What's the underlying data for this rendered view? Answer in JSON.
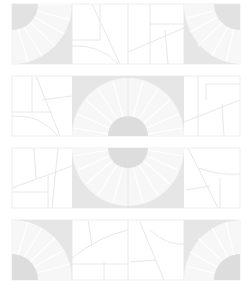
{
  "diagram": {
    "type": "tile-pattern",
    "rows": 4,
    "columns": 4,
    "colors": {
      "background": "#ffffff",
      "tile_fill": "#e6e6e6",
      "disc_fill": "#dddddd",
      "line": "#e8e8e8",
      "border": "#ececec"
    },
    "strips": [
      {
        "index": 1,
        "description": "quarter-circle staircase tiles at both ends, line tiles in middle"
      },
      {
        "index": 2,
        "description": "half-circle staircase centered, opening downward-bottom"
      },
      {
        "index": 3,
        "description": "half-circle staircase centered, mirrored at top"
      },
      {
        "index": 4,
        "description": "quarter-circle staircase tiles at both ends, mirrored at bottom"
      }
    ]
  }
}
